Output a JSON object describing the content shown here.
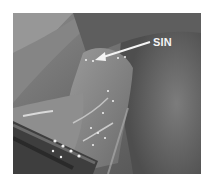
{
  "figure": {
    "annotation": {
      "label": "SIN",
      "arrow_direction": "left-down",
      "color": "#f4f4f4"
    },
    "colors": {
      "background": "#ffffff",
      "tissue_dark": "#4a4a4a",
      "tissue_mid": "#7a7a7a",
      "tissue_light": "#a8a8a8",
      "highlight": "#f0f0f0"
    }
  }
}
